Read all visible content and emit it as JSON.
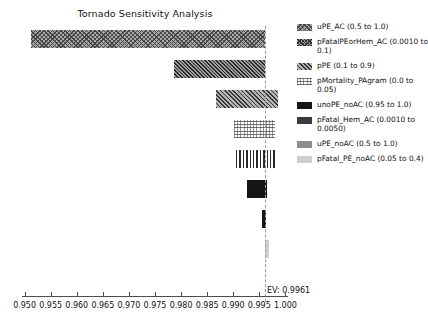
{
  "chart_data": {
    "type": "bar",
    "subtype": "tornado",
    "title": "Tornado Sensitivity Analysis",
    "xlabel": "",
    "ylabel": "",
    "xlim": [
      0.9495,
      1.0005
    ],
    "grid": false,
    "legend_position": "right",
    "expected_value": 0.9961,
    "expected_value_label": "EV: 0.9961",
    "xticks": [
      "0.950",
      "0.955",
      "0.960",
      "0.965",
      "0.970",
      "0.975",
      "0.980",
      "0.985",
      "0.990",
      "0.995",
      "1.000"
    ],
    "xtick_values": [
      0.95,
      0.955,
      0.96,
      0.965,
      0.97,
      0.975,
      0.98,
      0.985,
      0.99,
      0.995,
      1.0
    ],
    "categories": [
      "uPE_AC",
      "pFatalPEorHem_AC",
      "pPE",
      "pMortality_PAgram",
      "unoPE_noAC",
      "pFatal_Hem_AC",
      "uPE_noAC",
      "pFatal_PE_noAC"
    ],
    "bars": [
      {
        "name": "uPE_AC",
        "range_label": "(0.5 to 1.0)",
        "legend": "uPE_AC (0.5 to 1.0)",
        "low": 0.9512,
        "high": 0.9961,
        "pattern": "crosshatch",
        "swatch": "pat-crosshatch"
      },
      {
        "name": "pFatalPEorHem_AC",
        "range_label": "(0.0010 to 0.1)",
        "legend": "pFatalPEorHem_AC (0.0010 to 0.1)",
        "low": 0.9786,
        "high": 0.9961,
        "pattern": "diagonal",
        "swatch": "pat-crosshatch-dense"
      },
      {
        "name": "pPE",
        "range_label": "(0.1 to 0.9)",
        "legend": "pPE (0.1 to 0.9)",
        "low": 0.9866,
        "high": 0.9985,
        "pattern": "diagonal-dense",
        "swatch": "pat-diagonal"
      },
      {
        "name": "pMortality_PAgram",
        "range_label": "(0.0 to 0.05)",
        "legend": "pMortality_PAgram (0.0 to 0.05)",
        "low": 0.9902,
        "high": 0.998,
        "pattern": "dots",
        "swatch": "pat-dots"
      },
      {
        "name": "unoPE_noAC",
        "range_label": "(0.95 to 1.0)",
        "legend": "unoPE_noAC (0.95 to 1.0)",
        "low": 0.9906,
        "high": 0.9981,
        "pattern": "vlines",
        "swatch": "pat-solid-dark"
      },
      {
        "name": "pFatal_Hem_AC",
        "range_label": "(0.0010 to 0.0050)",
        "legend": "pFatal_Hem_AC (0.0010 to 0.0050)",
        "low": 0.9927,
        "high": 0.9965,
        "pattern": "solid-dark",
        "swatch": "pat-solid-dark2"
      },
      {
        "name": "uPE_noAC",
        "range_label": "(0.5 to 1.0)",
        "legend": "uPE_noAC (0.5 to 1.0)",
        "low": 0.9955,
        "high": 0.9963,
        "pattern": "solid-dark",
        "swatch": "pat-solid-mid"
      },
      {
        "name": "pFatal_PE_noAC",
        "range_label": "(0.05 to 0.4)",
        "legend": "pFatal_PE_noAC (0.05 to 0.4)",
        "low": 0.9961,
        "high": 0.9961,
        "pattern": "solid-light",
        "swatch": "pat-solid-light"
      }
    ]
  }
}
